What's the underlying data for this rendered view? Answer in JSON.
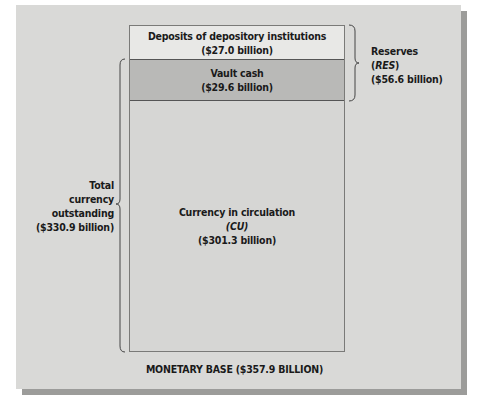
{
  "diagram": {
    "title": "MONETARY BASE ($357.9 BILLION)",
    "colors": {
      "panel": "#d9d9d7",
      "shadow": "#9c9c9a",
      "deposits_fill": "#e8e8e6",
      "vault_fill": "#b9b9b7",
      "currency_fill": "#d6d6d4",
      "text": "#1a1a1a"
    },
    "segments": {
      "deposits": {
        "label": "Deposits of depository institutions",
        "value": "($27.0 billion)",
        "amount_billion": 27.0
      },
      "vault_cash": {
        "label": "Vault cash",
        "value": "($29.6 billion)",
        "amount_billion": 29.6
      },
      "currency": {
        "label": "Currency in circulation",
        "abbrev": "(CU)",
        "value": "($301.3 billion)",
        "amount_billion": 301.3
      }
    },
    "braces": {
      "reserves": {
        "line1": "Reserves",
        "abbrev": "(RES)",
        "value": "($56.6 billion)",
        "amount_billion": 56.6
      },
      "total_currency": {
        "line1": "Total",
        "line2": "currency",
        "line3": "outstanding",
        "value": "($330.9 billion)",
        "amount_billion": 330.9
      }
    }
  }
}
